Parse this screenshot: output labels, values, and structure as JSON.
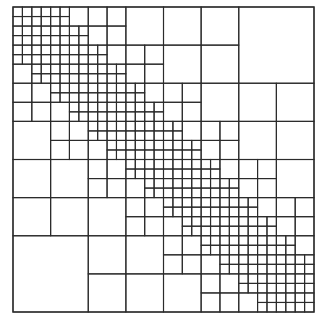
{
  "diagram": {
    "type": "hierarchical-matrix-block-partition",
    "matrix_size": 32,
    "leaf_size": 1,
    "admissibility_eta": 2,
    "frame": {
      "x": 13,
      "y": 7,
      "width": 301,
      "height": 305
    },
    "colors": {
      "line": "#2b2b2b",
      "background": "#ffffff"
    }
  }
}
